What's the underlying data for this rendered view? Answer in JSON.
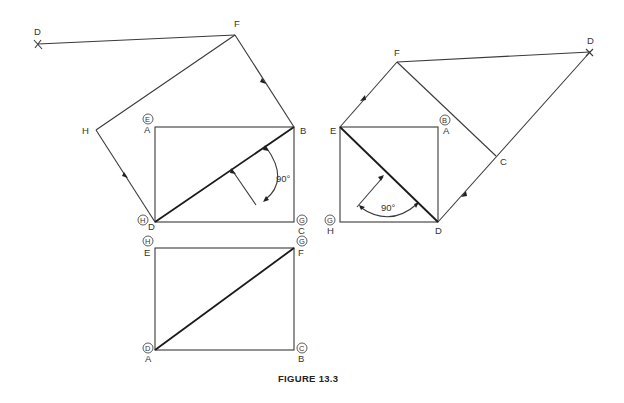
{
  "caption": "FIGURE 13.3",
  "angle_label": "90°",
  "left_view": {
    "rect_labels": {
      "A": "A",
      "B": "B",
      "C": "C",
      "D": "D"
    },
    "circled": {
      "E": "E",
      "H": "H",
      "G": "G"
    },
    "aux_points": {
      "F": "F",
      "H": "H",
      "D": "D"
    },
    "angle": "90°"
  },
  "bottom_view": {
    "rect_labels": {
      "E": "E",
      "F": "F",
      "A": "A",
      "B": "B"
    },
    "circled": {
      "H": "H",
      "G": "G",
      "D": "D",
      "C": "C"
    }
  },
  "right_view": {
    "rect_labels": {
      "E": "E",
      "A": "A",
      "D": "D",
      "H": "H"
    },
    "circled": {
      "B": "B",
      "G": "G"
    },
    "aux_points": {
      "F": "F",
      "C": "C",
      "D": "D"
    },
    "angle": "90°"
  },
  "colors": {
    "line": "#3a3a3a",
    "background": "#ffffff"
  }
}
